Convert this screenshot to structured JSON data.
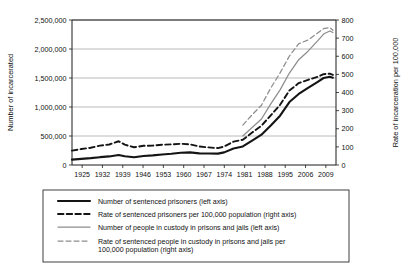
{
  "chart_data": {
    "type": "line",
    "title": "",
    "xlabel": "",
    "ylabel": "Number of incarcerated",
    "y2label": "Rate of incarceration per 100,000",
    "grid": true,
    "legend_position": "below-plot",
    "xlim": [
      1925,
      2010
    ],
    "ylim": [
      0,
      2500000
    ],
    "y2lim": [
      0,
      800
    ],
    "yticks": [
      "0",
      "500,000",
      "1,000,000",
      "1,500,000",
      "2,000,000",
      "2,500,000"
    ],
    "ytick_values": [
      0,
      500000,
      1000000,
      1500000,
      2000000,
      2500000
    ],
    "y2ticks": [
      "0",
      "100",
      "200",
      "300",
      "400",
      "500",
      "600",
      "700",
      "800"
    ],
    "y2tick_values": [
      0,
      100,
      200,
      300,
      400,
      500,
      600,
      700,
      800
    ],
    "xticks": [
      "1925",
      "1932",
      "1939",
      "1946",
      "1953",
      "1960",
      "1967",
      "1974",
      "1981",
      "1988",
      "1995",
      "2006",
      "2009"
    ],
    "xtick_values": [
      1925,
      1932,
      1939,
      1946,
      1953,
      1960,
      1967,
      1974,
      1981,
      1988,
      1995,
      2006,
      2009
    ],
    "series": [
      {
        "name": "Number of sentenced prisoners (left axis)",
        "axis": "left",
        "style": "black-solid",
        "x": [
          1925,
          1928,
          1931,
          1934,
          1937,
          1939,
          1940,
          1942,
          1945,
          1948,
          1951,
          1954,
          1957,
          1960,
          1963,
          1966,
          1969,
          1972,
          1974,
          1977,
          1980,
          1983,
          1986,
          1989,
          1992,
          1995,
          1998,
          2001,
          2004,
          2006,
          2008,
          2009
        ],
        "y": [
          92000,
          105000,
          118000,
          135000,
          148000,
          165000,
          172000,
          150000,
          133000,
          155000,
          166000,
          182000,
          195000,
          212000,
          218000,
          200000,
          197000,
          196000,
          218000,
          285000,
          320000,
          420000,
          523000,
          680000,
          850000,
          1085000,
          1225000,
          1330000,
          1430000,
          1500000,
          1520000,
          1505000
        ]
      },
      {
        "name": "Rate of sentenced prisoners per 100,000 population (right axis)",
        "axis": "right",
        "style": "black-dash",
        "x": [
          1925,
          1928,
          1931,
          1934,
          1937,
          1939,
          1940,
          1942,
          1945,
          1948,
          1951,
          1954,
          1957,
          1960,
          1963,
          1966,
          1969,
          1972,
          1974,
          1977,
          1980,
          1983,
          1986,
          1989,
          1992,
          1995,
          1998,
          2001,
          2004,
          2006,
          2008,
          2009
        ],
        "y": [
          79,
          88,
          95,
          107,
          113,
          125,
          131,
          112,
          98,
          106,
          107,
          112,
          114,
          117,
          114,
          102,
          97,
          93,
          102,
          129,
          139,
          179,
          217,
          274,
          332,
          411,
          452,
          470,
          486,
          501,
          504,
          497
        ]
      },
      {
        "name": "Number of people in custody in prisons and jails (left axis)",
        "axis": "left",
        "style": "gray-solid",
        "x": [
          1980,
          1983,
          1986,
          1989,
          1992,
          1995,
          1998,
          2001,
          2004,
          2006,
          2008,
          2009
        ],
        "y": [
          501000,
          648000,
          793000,
          1054000,
          1295000,
          1585000,
          1816000,
          1962000,
          2136000,
          2258000,
          2310000,
          2284000
        ]
      },
      {
        "name": "Rate of sentenced people in custody in prisons and jails per 100,000 population (right axis)",
        "axis": "right",
        "style": "gray-dash",
        "x": [
          1980,
          1983,
          1986,
          1989,
          1992,
          1995,
          1998,
          2001,
          2004,
          2006,
          2008,
          2009
        ],
        "y": [
          220,
          277,
          330,
          425,
          508,
          601,
          669,
          690,
          727,
          752,
          759,
          743
        ]
      }
    ]
  },
  "legend": {
    "entries": [
      {
        "label": "Number of sentenced prisoners (left axis)",
        "style": "black-solid"
      },
      {
        "label": "Rate of sentenced prisoners per 100,000 population (right axis)",
        "style": "black-dash"
      },
      {
        "label": "Number of people in custody in prisons and jails (left axis)",
        "style": "gray-solid"
      },
      {
        "label": "Rate of sentenced people in custody in prisons and jails per",
        "label2": "100,000 population (right axis)",
        "style": "gray-dash"
      }
    ]
  },
  "colors": {
    "black": "#141414",
    "gray": "#8d8d8d",
    "grid": "#a8a8a8",
    "background": "#ffffff"
  }
}
